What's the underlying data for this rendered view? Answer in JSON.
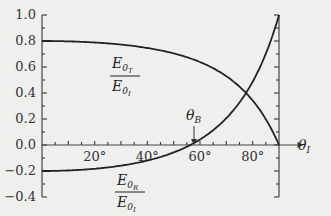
{
  "chart_data": {
    "type": "line",
    "title": "",
    "xlabel": "θ_I",
    "ylabel": "",
    "xlim": [
      0,
      90
    ],
    "ylim": [
      -0.4,
      1.0
    ],
    "grid": false,
    "x_tick_labels": [
      "20°",
      "40°",
      "60°",
      "80°"
    ],
    "x_ticks": [
      20,
      40,
      60,
      80
    ],
    "y_tick_labels": [
      "1.0",
      "0.8",
      "0.6",
      "0.4",
      "0.2",
      "0.0",
      "−0.2",
      "−0.4"
    ],
    "y_ticks": [
      1.0,
      0.8,
      0.6,
      0.4,
      0.2,
      0.0,
      -0.2,
      -0.4
    ],
    "x": [
      0,
      10,
      20,
      30,
      40,
      50,
      56.3,
      60,
      70,
      80,
      85,
      90
    ],
    "series": [
      {
        "name": "E0T/E0I",
        "label_num": "E0T",
        "label_den": "E0I",
        "values": [
          0.8,
          0.797,
          0.789,
          0.773,
          0.746,
          0.705,
          0.667,
          0.638,
          0.529,
          0.342,
          0.198,
          0.0
        ]
      },
      {
        "name": "E0R/E0I",
        "label_num": "E0R",
        "label_den": "E0I",
        "values": [
          -0.2,
          -0.196,
          -0.183,
          -0.159,
          -0.12,
          -0.057,
          0.0,
          0.042,
          0.206,
          0.487,
          0.702,
          1.0
        ]
      }
    ],
    "annotations": [
      {
        "text": "θB",
        "x": 56.3,
        "y": 0.0,
        "type": "arrow"
      }
    ]
  },
  "labels": {
    "theta_B": "θ",
    "theta_B_sub": "B",
    "theta_I": "θ",
    "theta_I_sub": "I",
    "T_num": "E",
    "T_num_sub": "0",
    "T_num_subsub": "T",
    "T_den": "E",
    "T_den_sub": "0",
    "T_den_subsub": "I",
    "R_num": "E",
    "R_num_sub": "0",
    "R_num_subsub": "R",
    "R_den": "E",
    "R_den_sub": "0",
    "R_den_subsub": "I"
  }
}
